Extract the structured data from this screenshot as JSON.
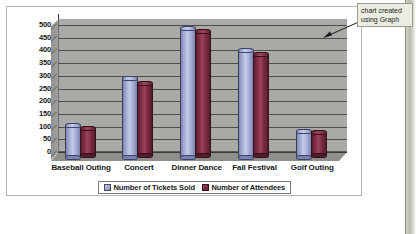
{
  "document": {
    "page_edge_band": "page-margin-band"
  },
  "callout": {
    "text": "chart created\nusing Graph",
    "arrow_icon": "arrow-pointer-icon"
  },
  "chart_data": {
    "type": "bar",
    "title": "",
    "subtitle": "",
    "xlabel": "",
    "ylabel": "",
    "categories": [
      "Baseball Outing",
      "Concert",
      "Dinner Dance",
      "Fall Festival",
      "Golf Outing"
    ],
    "series": [
      {
        "name": "Number of Tickets Sold",
        "color": "#a3abd4",
        "values": [
          125,
          308,
          505,
          420,
          100
        ]
      },
      {
        "name": "Number of Attendees",
        "color": "#7f2c44",
        "values": [
          105,
          280,
          488,
          395,
          90
        ]
      }
    ],
    "ylim": [
      0,
      500
    ],
    "ytick_step": 50,
    "ytick_labels": [
      "0",
      "50",
      "100",
      "150",
      "200",
      "250",
      "300",
      "350",
      "400",
      "450",
      "500"
    ],
    "grid": true,
    "grid_axis": "y",
    "legend_position": "bottom",
    "style": "3d-cylinder",
    "plot_background": "#a9a9a6"
  },
  "colors": {
    "plot_background": "#a9a9a6",
    "gridline": "#4f4f4e",
    "series_tickets": "#a3abd4",
    "series_attendees": "#7f2c44",
    "callout_background": "#ebece2",
    "frame_border": "#b8b8b8"
  }
}
